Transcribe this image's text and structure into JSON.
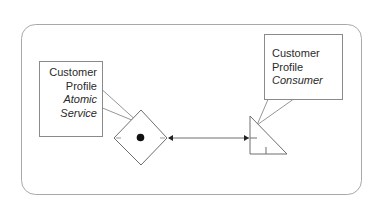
{
  "diagram": {
    "type": "service-interaction",
    "container": {
      "shape": "rounded-rectangle"
    },
    "nodes": [
      {
        "id": "atomic-service",
        "shape": "diamond-with-dot",
        "callout": {
          "line1": "Customer",
          "line2": "Profile",
          "line3": "Atomic",
          "line4": "Service"
        }
      },
      {
        "id": "consumer",
        "shape": "right-triangle",
        "callout": {
          "line1": "Customer",
          "line2": "Profile",
          "line3": "Consumer"
        }
      }
    ],
    "edges": [
      {
        "from": "atomic-service",
        "to": "consumer",
        "style": "bidirectional-arrow"
      }
    ],
    "colors": {
      "stroke": "#6e6e6e",
      "container_stroke": "#a8a8a8",
      "text": "#2a2a2a",
      "dot": "#111111",
      "background": "#ffffff"
    }
  }
}
